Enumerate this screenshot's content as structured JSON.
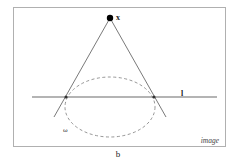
{
  "figure": {
    "caption": "b",
    "frame_label": "image",
    "colors": {
      "background": "#ffffff",
      "frame": "#b0b0b0",
      "line": "#6a6a6a",
      "ellipse": "#8a8a8a",
      "point": "#000000",
      "text": "#222222"
    }
  },
  "elements": {
    "point": {
      "label": "x",
      "cx": 110,
      "cy": 18
    },
    "line": {
      "label": "l",
      "y": 97,
      "x1": 32,
      "x2": 217
    },
    "conic": {
      "label": "ω",
      "cx": 110,
      "cy": 107,
      "rx": 45,
      "ry": 30,
      "style": "dashed"
    },
    "tangent_points": [
      {
        "x": 66,
        "y": 97
      },
      {
        "x": 154,
        "y": 97
      }
    ],
    "cone_lines": [
      {
        "x1": 110,
        "y1": 18,
        "x2": 54,
        "y2": 117
      },
      {
        "x1": 110,
        "y1": 18,
        "x2": 166,
        "y2": 117
      }
    ]
  }
}
